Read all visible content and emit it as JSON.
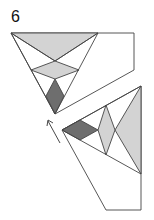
{
  "step_number": "6",
  "colors": {
    "light": "#d3d3d3",
    "dark": "#6e6e6e",
    "line": "#444444"
  },
  "figures": [
    "folded-triangle-top",
    "rotated-triangle-bottom"
  ],
  "arrow": "rotate-arrow"
}
